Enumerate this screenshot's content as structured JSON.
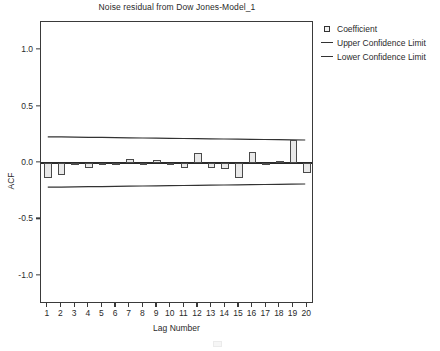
{
  "chart_data": {
    "type": "bar",
    "title": "Noise residual from Dow Jones-Model_1",
    "xlabel": "Lag Number",
    "ylabel": "ACF",
    "grid": false,
    "legend_position": "right-top",
    "ylim": [
      -1.25,
      1.25
    ],
    "xlim": [
      0.5,
      20.5
    ],
    "ytick_labels": [
      "1.0",
      "0.5",
      "0.0",
      "-0.5",
      "-1.0"
    ],
    "ytick_values": [
      1.0,
      0.5,
      0.0,
      -0.5,
      -1.0
    ],
    "categories": [
      "1",
      "2",
      "3",
      "4",
      "5",
      "6",
      "7",
      "8",
      "9",
      "10",
      "11",
      "12",
      "13",
      "14",
      "15",
      "16",
      "17",
      "18",
      "19",
      "20"
    ],
    "series": [
      {
        "name": "Coefficient",
        "type": "bar",
        "values": [
          -0.13,
          -0.11,
          -0.02,
          -0.04,
          -0.006,
          -0.016,
          0.036,
          -0.02,
          0.03,
          -0.016,
          -0.04,
          0.085,
          -0.04,
          -0.05,
          -0.13,
          0.095,
          -0.018,
          0.02,
          0.2,
          -0.09
        ]
      },
      {
        "name": "Upper Confidence Limit",
        "type": "line",
        "values": [
          0.225,
          0.2235,
          0.222,
          0.2205,
          0.219,
          0.2175,
          0.216,
          0.2145,
          0.213,
          0.2115,
          0.21,
          0.2085,
          0.207,
          0.2055,
          0.204,
          0.2025,
          0.201,
          0.1995,
          0.198,
          0.1965
        ]
      },
      {
        "name": "Lower Confidence Limit",
        "type": "line",
        "values": [
          -0.225,
          -0.2235,
          -0.222,
          -0.2205,
          -0.219,
          -0.2175,
          -0.216,
          -0.2145,
          -0.213,
          -0.2115,
          -0.21,
          -0.2085,
          -0.207,
          -0.2055,
          -0.204,
          -0.2025,
          -0.201,
          -0.1995,
          -0.198,
          -0.1965
        ]
      }
    ]
  },
  "legend": {
    "items": [
      {
        "label": "Coefficient",
        "key": "square"
      },
      {
        "label": "Upper Confidence Limit",
        "key": "line"
      },
      {
        "label": "Lower Confidence Limit",
        "key": "line"
      }
    ]
  },
  "colors": {
    "bar_fill": "#e9e9e9",
    "bar_stroke": "#4a4a4a",
    "axis": "#3a3a3a",
    "line": "#333333",
    "text": "#2a2a2a",
    "background": "#ffffff"
  }
}
